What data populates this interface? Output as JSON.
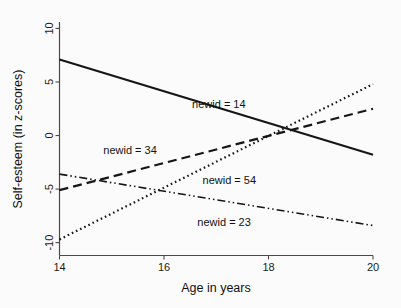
{
  "chart_data": {
    "type": "line",
    "title": "",
    "xlabel": "Age in years",
    "ylabel": "Self-esteem (in z-scores)",
    "xlim": [
      14,
      20
    ],
    "ylim": [
      -11.2,
      10.6
    ],
    "xticks": [
      14,
      16,
      18,
      20
    ],
    "xtick_labels": [
      "14",
      "16",
      "18",
      "20"
    ],
    "yticks": [
      10,
      5,
      0,
      -5,
      -10
    ],
    "ytick_labels": [
      "10",
      "5",
      "0",
      "-5",
      "-10"
    ],
    "grid": false,
    "legend": "inline-annotations",
    "x": [
      14,
      20
    ],
    "series": [
      {
        "name": "newid = 14",
        "label": "newid = 14",
        "linestyle": "solid",
        "dash_pattern": "none",
        "color": "#161616",
        "linewidth": 2.2,
        "values": [
          7.1,
          -1.8
        ],
        "label_x": 17.05,
        "label_y": 2.55
      },
      {
        "name": "newid = 34",
        "label": "newid = 34",
        "linestyle": "dashed",
        "dash_pattern": "9,5",
        "color": "#161616",
        "linewidth": 2.2,
        "values": [
          -5.1,
          2.5
        ],
        "label_x": 15.35,
        "label_y": -1.75
      },
      {
        "name": "newid = 54",
        "label": "newid = 54",
        "linestyle": "dotted",
        "dash_pattern": "1.6,3",
        "color": "#161616",
        "linewidth": 2.2,
        "values": [
          -9.7,
          4.8
        ],
        "label_x": 17.25,
        "label_y": -4.55
      },
      {
        "name": "newid = 23",
        "label": "newid = 23",
        "linestyle": "dash-dot-dot",
        "dash_pattern": "8,3,1.5,3,1.5,3",
        "color": "#161616",
        "linewidth": 1.6,
        "values": [
          -3.6,
          -8.4
        ],
        "label_x": 17.15,
        "label_y": -8.45
      }
    ]
  },
  "axes": {
    "x_axis_title": "Age in years",
    "y_axis_title": "Self-esteem (in z-scores)"
  }
}
